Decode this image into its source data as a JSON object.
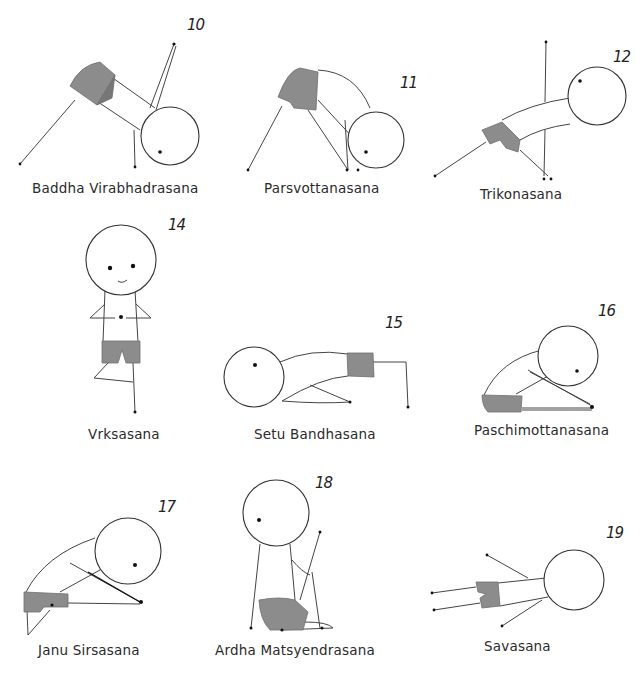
{
  "poses": [
    {
      "number": "10",
      "name": "Baddha Virabhadrasana"
    },
    {
      "number": "11",
      "name": "Parsvottanasana"
    },
    {
      "number": "12",
      "name": "Trikonasana"
    },
    {
      "number": "14",
      "name": "Vrksasana"
    },
    {
      "number": "15",
      "name": "Setu Bandhasana"
    },
    {
      "number": "16",
      "name": "Paschimottanasana"
    },
    {
      "number": "17",
      "name": "Janu Sirsasana"
    },
    {
      "number": "18",
      "name": "Ardha Matsyendrasana"
    },
    {
      "number": "19",
      "name": "Savasana"
    }
  ],
  "colors": {
    "shorts": "#8c8c8c",
    "outline": "#333333",
    "background": "#ffffff"
  }
}
